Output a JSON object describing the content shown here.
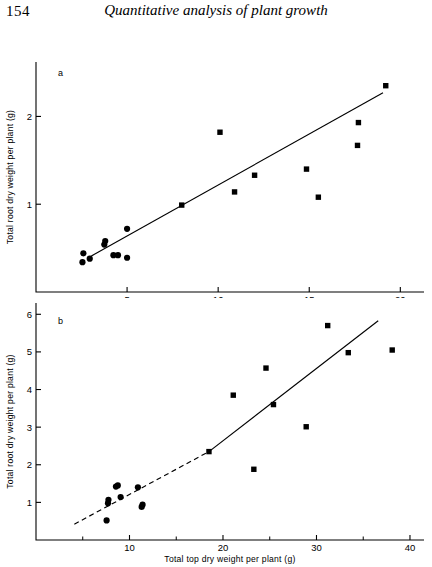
{
  "page": {
    "folio": "154",
    "running_head": "Quantitative analysis of plant growth"
  },
  "chart_data": [
    {
      "id": "panel-a",
      "type": "scatter",
      "panel_label": "a",
      "title": "",
      "xlabel": "Total top dry weight per plant (g)",
      "ylabel": "Total root dry weight per plant (g)",
      "xlim": [
        0,
        21.3
      ],
      "ylim": [
        0,
        2.62
      ],
      "xticks": [
        5,
        10,
        15,
        20
      ],
      "xtick_labels": [
        "5",
        "10",
        "15",
        "20"
      ],
      "yticks": [
        1,
        2
      ],
      "ytick_labels": [
        "1",
        "2"
      ],
      "grid": false,
      "legend": "none",
      "series": [
        {
          "name": "circle-series",
          "marker": "circle",
          "points": [
            [
              2.55,
              0.34
            ],
            [
              2.6,
              0.44
            ],
            [
              2.95,
              0.38
            ],
            [
              3.75,
              0.54
            ],
            [
              3.8,
              0.58
            ],
            [
              4.25,
              0.42
            ],
            [
              4.5,
              0.42
            ],
            [
              5.0,
              0.39
            ],
            [
              5.0,
              0.72
            ]
          ]
        },
        {
          "name": "square-series",
          "marker": "square",
          "points": [
            [
              8.0,
              0.99
            ],
            [
              10.1,
              1.82
            ],
            [
              10.9,
              1.14
            ],
            [
              12.0,
              1.33
            ],
            [
              14.85,
              1.4
            ],
            [
              15.5,
              1.08
            ],
            [
              17.65,
              1.67
            ],
            [
              17.7,
              1.93
            ],
            [
              19.2,
              2.35
            ]
          ]
        }
      ],
      "fit_line": {
        "style": "solid",
        "x_start": 2.95,
        "y_start": 0.4,
        "x_end": 19.05,
        "y_end": 2.27
      }
    },
    {
      "id": "panel-b",
      "type": "scatter",
      "panel_label": "b",
      "title": "",
      "xlabel": "Total top dry weight per plant (g)",
      "ylabel": "Total root dry weight per plant (g)",
      "xlim": [
        0,
        41.5
      ],
      "ylim": [
        0,
        6.3
      ],
      "xticks": [
        10,
        20,
        30,
        40
      ],
      "xtick_labels": [
        "10",
        "20",
        "30",
        "40"
      ],
      "xticks_minor": [
        5,
        15,
        25,
        35
      ],
      "yticks": [
        1,
        2,
        3,
        4,
        5,
        6
      ],
      "ytick_labels": [
        "1",
        "2",
        "3",
        "4",
        "5",
        "6"
      ],
      "grid": false,
      "legend": "none",
      "series": [
        {
          "name": "circle-series",
          "marker": "circle",
          "points": [
            [
              7.55,
              0.52
            ],
            [
              7.7,
              0.98
            ],
            [
              7.75,
              1.07
            ],
            [
              8.55,
              1.42
            ],
            [
              8.75,
              1.45
            ],
            [
              9.05,
              1.14
            ],
            [
              10.9,
              1.4
            ],
            [
              11.3,
              0.88
            ],
            [
              11.4,
              0.94
            ]
          ]
        },
        {
          "name": "square-series",
          "marker": "square",
          "points": [
            [
              18.5,
              2.35
            ],
            [
              21.1,
              3.85
            ],
            [
              23.3,
              1.88
            ],
            [
              24.6,
              4.57
            ],
            [
              25.4,
              3.6
            ],
            [
              28.9,
              3.01
            ],
            [
              31.2,
              5.7
            ],
            [
              33.4,
              4.98
            ],
            [
              38.1,
              5.05
            ]
          ]
        }
      ],
      "fit_line": {
        "style": "dashed-then-solid",
        "x_start": 4.1,
        "y_start": 0.42,
        "x_break": 18.5,
        "y_break": 2.35,
        "x_end": 36.6,
        "y_end": 5.83
      }
    }
  ]
}
